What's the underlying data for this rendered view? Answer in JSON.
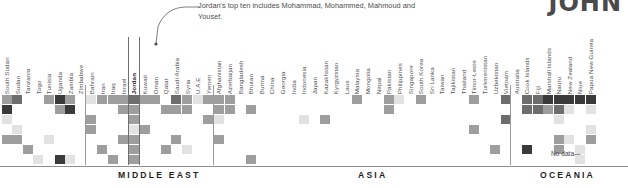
{
  "corner_title": "JOHN",
  "annotation": {
    "text": "Jordan's top ten includes Mohammad, Mohammed, Mahmoud and Yousef.",
    "target": "Jordan"
  },
  "no_data_label": "No data—",
  "regions": [
    {
      "name": "MIDDLE EAST",
      "label": "MIDDLE EAST",
      "x": 118
    },
    {
      "name": "ASIA",
      "label": "ASIA",
      "x": 358
    },
    {
      "name": "OCEANIA",
      "label": "OCEANIA",
      "x": 540
    }
  ],
  "highlight_column": "Jordan",
  "columns": [
    "South Sudan",
    "Sudan",
    "Tanzania",
    "Togo",
    "Tunisia",
    "Uganda",
    "Zambia",
    "Zimbabwe",
    "Bahrain",
    "Iran",
    "Iraq",
    "Israel",
    "Jordan",
    "Kuwait",
    "Oman",
    "Qatar",
    "Saudi Arabia",
    "Syria",
    "U.A.E",
    "Yemen",
    "Afghanistan",
    "Azerbaijan",
    "Bangladesh",
    "Bhutan",
    "Burma",
    "China",
    "Georgia",
    "India",
    "Indonesia",
    "Japan",
    "Kazakhstan",
    "Kyrgyzstan",
    "Laos",
    "Malaysia",
    "Mongolia",
    "Nepal",
    "Pakistan",
    "Philippines",
    "Singapore",
    "South Korea",
    "Sri Lanka",
    "Taiwan",
    "Tajikistan",
    "Thailand",
    "Timor-Leste",
    "Turkmenistan",
    "Uzbekistan",
    "Vietnam",
    "Australia",
    "Cook Islands",
    "Fiji",
    "Marshall Islands",
    "Nauru",
    "New Zealand",
    "Niue",
    "Papua New Guinea"
  ],
  "chart_data": {
    "type": "heatmap",
    "title": "",
    "xlabel": "",
    "ylabel": "",
    "rows": 7,
    "colors": {
      "empty": "#ffffff",
      "light": "#e2e2e2",
      "lightmid": "#c9c9c9",
      "mid": "#9e9e9e",
      "dark": "#6d6d6d",
      "darkest": "#3a3a3a"
    },
    "legend_position": "none",
    "grid": false,
    "cells": [
      {
        "c": 0,
        "r": 0,
        "v": "mid"
      },
      {
        "c": 1,
        "r": 0,
        "v": "dark"
      },
      {
        "c": 0,
        "r": 1,
        "v": "darkest"
      },
      {
        "c": 0,
        "r": 2,
        "v": "light"
      },
      {
        "c": 0,
        "r": 4,
        "v": "mid"
      },
      {
        "c": 1,
        "r": 4,
        "v": "mid"
      },
      {
        "c": 2,
        "r": 5,
        "v": "mid"
      },
      {
        "c": 1,
        "r": 3,
        "v": "light"
      },
      {
        "c": 4,
        "r": 0,
        "v": "mid"
      },
      {
        "c": 5,
        "r": 0,
        "v": "darkest"
      },
      {
        "c": 6,
        "r": 0,
        "v": "mid"
      },
      {
        "c": 5,
        "r": 1,
        "v": "mid"
      },
      {
        "c": 6,
        "r": 1,
        "v": "darkest"
      },
      {
        "c": 4,
        "r": 4,
        "v": "light"
      },
      {
        "c": 3,
        "r": 6,
        "v": "light"
      },
      {
        "c": 5,
        "r": 6,
        "v": "darkest"
      },
      {
        "c": 6,
        "r": 6,
        "v": "light"
      },
      {
        "c": 8,
        "r": 0,
        "v": "light"
      },
      {
        "c": 9,
        "r": 0,
        "v": "mid"
      },
      {
        "c": 10,
        "r": 0,
        "v": "mid"
      },
      {
        "c": 8,
        "r": 2,
        "v": "mid"
      },
      {
        "c": 8,
        "r": 3,
        "v": "mid"
      },
      {
        "c": 9,
        "r": 5,
        "v": "mid"
      },
      {
        "c": 10,
        "r": 6,
        "v": "mid"
      },
      {
        "c": 11,
        "r": 0,
        "v": "mid"
      },
      {
        "c": 12,
        "r": 0,
        "v": "dark"
      },
      {
        "c": 12,
        "r": 1,
        "v": "mid"
      },
      {
        "c": 11,
        "r": 1,
        "v": "mid"
      },
      {
        "c": 12,
        "r": 2,
        "v": "mid"
      },
      {
        "c": 12,
        "r": 3,
        "v": "light"
      },
      {
        "c": 12,
        "r": 4,
        "v": "mid"
      },
      {
        "c": 12,
        "r": 5,
        "v": "mid"
      },
      {
        "c": 12,
        "r": 6,
        "v": "mid"
      },
      {
        "c": 11,
        "r": 4,
        "v": "mid"
      },
      {
        "c": 13,
        "r": 0,
        "v": "mid"
      },
      {
        "c": 14,
        "r": 0,
        "v": "mid"
      },
      {
        "c": 15,
        "r": 1,
        "v": "mid"
      },
      {
        "c": 13,
        "r": 3,
        "v": "mid"
      },
      {
        "c": 16,
        "r": 0,
        "v": "dark"
      },
      {
        "c": 17,
        "r": 0,
        "v": "mid"
      },
      {
        "c": 18,
        "r": 0,
        "v": "light"
      },
      {
        "c": 16,
        "r": 1,
        "v": "mid"
      },
      {
        "c": 17,
        "r": 1,
        "v": "mid"
      },
      {
        "c": 16,
        "r": 4,
        "v": "mid"
      },
      {
        "c": 15,
        "r": 5,
        "v": "mid"
      },
      {
        "c": 17,
        "r": 5,
        "v": "light"
      },
      {
        "c": 19,
        "r": 0,
        "v": "mid"
      },
      {
        "c": 19,
        "r": 2,
        "v": "mid"
      },
      {
        "c": 20,
        "r": 0,
        "v": "mid"
      },
      {
        "c": 21,
        "r": 0,
        "v": "mid"
      },
      {
        "c": 20,
        "r": 1,
        "v": "mid"
      },
      {
        "c": 21,
        "r": 1,
        "v": "mid"
      },
      {
        "c": 20,
        "r": 2,
        "v": "light"
      },
      {
        "c": 20,
        "r": 4,
        "v": "mid"
      },
      {
        "c": 23,
        "r": 1,
        "v": "mid"
      },
      {
        "c": 23,
        "r": 6,
        "v": "mid"
      },
      {
        "c": 28,
        "r": 2,
        "v": "light"
      },
      {
        "c": 30,
        "r": 2,
        "v": "mid"
      },
      {
        "c": 33,
        "r": 0,
        "v": "mid"
      },
      {
        "c": 36,
        "r": 0,
        "v": "mid"
      },
      {
        "c": 37,
        "r": 0,
        "v": "light"
      },
      {
        "c": 36,
        "r": 1,
        "v": "mid"
      },
      {
        "c": 39,
        "r": 0,
        "v": "mid"
      },
      {
        "c": 44,
        "r": 0,
        "v": "mid"
      },
      {
        "c": 44,
        "r": 3,
        "v": "mid"
      },
      {
        "c": 47,
        "r": 0,
        "v": "dark"
      },
      {
        "c": 47,
        "r": 2,
        "v": "dark"
      },
      {
        "c": 46,
        "r": 5,
        "v": "mid"
      },
      {
        "c": 49,
        "r": 0,
        "v": "dark"
      },
      {
        "c": 50,
        "r": 0,
        "v": "dark"
      },
      {
        "c": 51,
        "r": 0,
        "v": "darkest"
      },
      {
        "c": 52,
        "r": 0,
        "v": "darkest"
      },
      {
        "c": 53,
        "r": 0,
        "v": "darkest"
      },
      {
        "c": 54,
        "r": 0,
        "v": "darkest"
      },
      {
        "c": 55,
        "r": 0,
        "v": "darkest"
      },
      {
        "c": 49,
        "r": 1,
        "v": "dark"
      },
      {
        "c": 50,
        "r": 1,
        "v": "dark"
      },
      {
        "c": 51,
        "r": 1,
        "v": "mid"
      },
      {
        "c": 52,
        "r": 1,
        "v": "dark"
      },
      {
        "c": 53,
        "r": 1,
        "v": "light"
      },
      {
        "c": 55,
        "r": 1,
        "v": "light"
      },
      {
        "c": 52,
        "r": 2,
        "v": "light"
      },
      {
        "c": 55,
        "r": 3,
        "v": "light"
      },
      {
        "c": 55,
        "r": 4,
        "v": "mid"
      },
      {
        "c": 52,
        "r": 4,
        "v": "mid"
      },
      {
        "c": 53,
        "r": 4,
        "v": "light"
      },
      {
        "c": 52,
        "r": 5,
        "v": "mid"
      },
      {
        "c": 49,
        "r": 5,
        "v": "darkest"
      },
      {
        "c": 54,
        "r": 5,
        "v": "light"
      },
      {
        "c": 54,
        "r": 6,
        "v": "light"
      }
    ]
  }
}
